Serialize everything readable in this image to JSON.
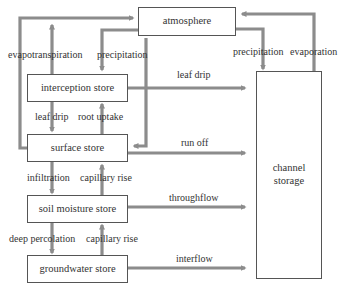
{
  "diagram": {
    "type": "flow diagram",
    "nodes": {
      "atmosphere": "atmosphere",
      "interception": "interception store",
      "surface": "surface store",
      "soil": "soil moisture store",
      "groundwater": "groundwater store",
      "channel_line1": "channel",
      "channel_line2": "storage"
    },
    "labels": {
      "evapotranspiration": "evapotranspiration",
      "precipitation_left": "precipitation",
      "leaf_drip_right": "leaf drip",
      "leaf_drip_down": "leaf drip",
      "root_uptake": "root uptake",
      "run_off": "run off",
      "infiltration": "infiltration",
      "capillary_rise_1": "capillary rise",
      "throughflow": "throughflow",
      "deep_percolation": "deep percolation",
      "capillary_rise_2": "capillary rise",
      "interflow": "interflow",
      "precipitation_right": "precipitation",
      "evaporation": "evaporation"
    },
    "edges": [
      {
        "from": "surface store",
        "to": "atmosphere",
        "label": "evapotranspiration"
      },
      {
        "from": "interception store",
        "to": "atmosphere",
        "label": "evapotranspiration"
      },
      {
        "from": "atmosphere",
        "to": "interception store",
        "label": "precipitation"
      },
      {
        "from": "atmosphere",
        "to": "surface store",
        "label": "precipitation"
      },
      {
        "from": "interception store",
        "to": "channel storage",
        "label": "leaf drip"
      },
      {
        "from": "interception store",
        "to": "surface store",
        "label": "leaf drip"
      },
      {
        "from": "surface store",
        "to": "interception store",
        "label": "root uptake"
      },
      {
        "from": "surface store",
        "to": "channel storage",
        "label": "run off"
      },
      {
        "from": "surface store",
        "to": "soil moisture store",
        "label": "infiltration"
      },
      {
        "from": "soil moisture store",
        "to": "surface store",
        "label": "capillary rise"
      },
      {
        "from": "soil moisture store",
        "to": "channel storage",
        "label": "throughflow"
      },
      {
        "from": "soil moisture store",
        "to": "groundwater store",
        "label": "deep percolation"
      },
      {
        "from": "groundwater store",
        "to": "soil moisture store",
        "label": "capillary rise"
      },
      {
        "from": "groundwater store",
        "to": "channel storage",
        "label": "interflow"
      },
      {
        "from": "atmosphere",
        "to": "channel storage",
        "label": "precipitation"
      },
      {
        "from": "channel storage",
        "to": "atmosphere",
        "label": "evaporation"
      }
    ],
    "colors": {
      "arrow": "#8c8c8c",
      "border": "#555555",
      "text": "#333333"
    }
  }
}
